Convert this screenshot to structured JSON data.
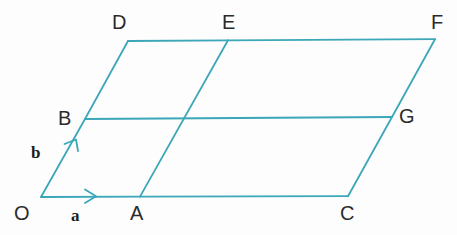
{
  "figure": {
    "background_color": "#fdfdfd",
    "stroke_color": "#3ba7b8",
    "label_color": "#2b2b2b",
    "vector_label_color": "#1d1d1d",
    "stroke_width": 1.8
  },
  "vertices": [
    {
      "id": "O",
      "label": "O",
      "x": 41,
      "y": 197,
      "label_x": 14,
      "label_y": 203
    },
    {
      "id": "A",
      "label": "A",
      "x": 140,
      "y": 196,
      "label_x": 130,
      "label_y": 203
    },
    {
      "id": "C",
      "label": "C",
      "x": 348,
      "y": 196,
      "label_x": 340,
      "label_y": 203
    },
    {
      "id": "B",
      "label": "B",
      "x": 85,
      "y": 119,
      "label_x": 58,
      "label_y": 108
    },
    {
      "id": "G",
      "label": "G",
      "x": 392,
      "y": 117,
      "label_x": 399,
      "label_y": 106
    },
    {
      "id": "D",
      "label": "D",
      "x": 128,
      "y": 41,
      "label_x": 112,
      "label_y": 12
    },
    {
      "id": "E",
      "label": "E",
      "x": 228,
      "y": 40,
      "label_x": 222,
      "label_y": 12
    },
    {
      "id": "F",
      "label": "F",
      "x": 435,
      "y": 39,
      "label_x": 431,
      "label_y": 12
    }
  ],
  "edges": [
    {
      "name": "edge-O-A-C",
      "from": "O",
      "to": "C",
      "via": "A",
      "description": "bottom horizontal side through A to C"
    },
    {
      "name": "edge-B-G",
      "from": "B",
      "to": "G",
      "description": "middle horizontal line"
    },
    {
      "name": "edge-D-E-F",
      "from": "D",
      "to": "F",
      "via": "E",
      "description": "top horizontal side through E to F"
    },
    {
      "name": "edge-O-B-D",
      "from": "O",
      "to": "D",
      "via": "B",
      "description": "left slanted side through B to D"
    },
    {
      "name": "edge-A-E",
      "from": "A",
      "to": "E",
      "description": "middle slanted line from A to E"
    },
    {
      "name": "edge-C-G-F",
      "from": "C",
      "to": "F",
      "via": "G",
      "description": "right slanted side through G to F"
    }
  ],
  "vectors": [
    {
      "id": "a",
      "label": "a",
      "from": "O",
      "to": "A",
      "arrow_tip_x": 96,
      "arrow_tip_y": 196,
      "label_x": 71,
      "label_y": 207,
      "description": "vector a along OA pointing right"
    },
    {
      "id": "b",
      "label": "b",
      "from": "O",
      "to": "B",
      "arrow_tip_x": 76,
      "arrow_tip_y": 140,
      "label_x": 31,
      "label_y": 144,
      "description": "vector b along OB pointing up-right"
    }
  ]
}
